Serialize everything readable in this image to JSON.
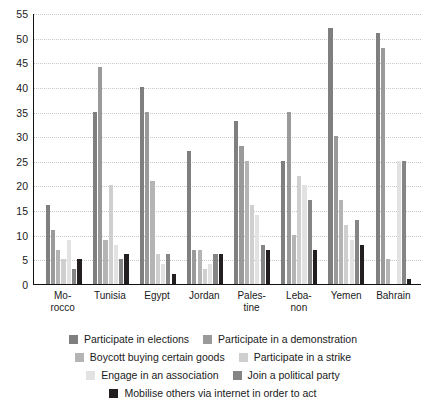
{
  "chart_data": {
    "type": "bar",
    "title": "",
    "subtitle": "",
    "xlabel": "",
    "ylabel": "",
    "ylim": [
      0,
      55
    ],
    "ytick_step": 5,
    "yticks": [
      0,
      5,
      10,
      15,
      20,
      25,
      30,
      35,
      40,
      45,
      50,
      55
    ],
    "grid": true,
    "grid_axis": "y",
    "legend_position": "bottom",
    "categories": [
      "Mo-\nrocco",
      "Tunisia",
      "Egypt",
      "Jordan",
      "Pales-\ntine",
      "Leba-\nnon",
      "Yemen",
      "Bahrain"
    ],
    "category_lines": [
      [
        "Mo-",
        "rocco"
      ],
      [
        "Tunisia",
        ""
      ],
      [
        "Egypt",
        ""
      ],
      [
        "Jordan",
        ""
      ],
      [
        "Pales-",
        "tine"
      ],
      [
        "Leba-",
        "non"
      ],
      [
        "Yemen",
        ""
      ],
      [
        "Bahrain",
        ""
      ]
    ],
    "series": [
      {
        "name": "Participate in elections",
        "color": "#7f7f7f",
        "values": [
          16,
          35,
          40,
          27,
          33,
          25,
          52,
          51
        ]
      },
      {
        "name": "Participate in a demonstration",
        "color": "#9a9a9a",
        "values": [
          11,
          44,
          35,
          7,
          28,
          35,
          30,
          48
        ]
      },
      {
        "name": "Boycott buying certain goods",
        "color": "#b4b4b4",
        "values": [
          7,
          9,
          21,
          7,
          25,
          10,
          17,
          5
        ]
      },
      {
        "name": "Participate in a strike",
        "color": "#cfcfcf",
        "values": [
          5,
          20,
          6,
          3,
          16,
          22,
          12,
          0
        ]
      },
      {
        "name": "Engage in an association",
        "color": "#e2e2e2",
        "values": [
          9,
          8,
          4,
          4,
          14,
          20,
          9,
          25
        ]
      },
      {
        "name": "Join a political party",
        "color": "#858585",
        "values": [
          3,
          5,
          6,
          6,
          8,
          17,
          13,
          25
        ]
      },
      {
        "name": "Mobilise others via internet in order to act",
        "color": "#231f20",
        "values": [
          5,
          6,
          2,
          6,
          7,
          7,
          8,
          1
        ]
      }
    ]
  },
  "legend": {
    "rows": [
      [
        {
          "label": "Participate in elections",
          "color": "#7f7f7f"
        },
        {
          "label": "Participate in a demonstration",
          "color": "#9a9a9a"
        }
      ],
      [
        {
          "label": "Boycott buying certain goods",
          "color": "#b4b4b4"
        },
        {
          "label": "Participate in a strike",
          "color": "#cfcfcf"
        }
      ],
      [
        {
          "label": "Engage in an association",
          "color": "#e2e2e2"
        },
        {
          "label": "Join a political party",
          "color": "#858585"
        }
      ],
      [
        {
          "label": "Mobilise others via internet in order to act",
          "color": "#231f20"
        }
      ]
    ]
  }
}
